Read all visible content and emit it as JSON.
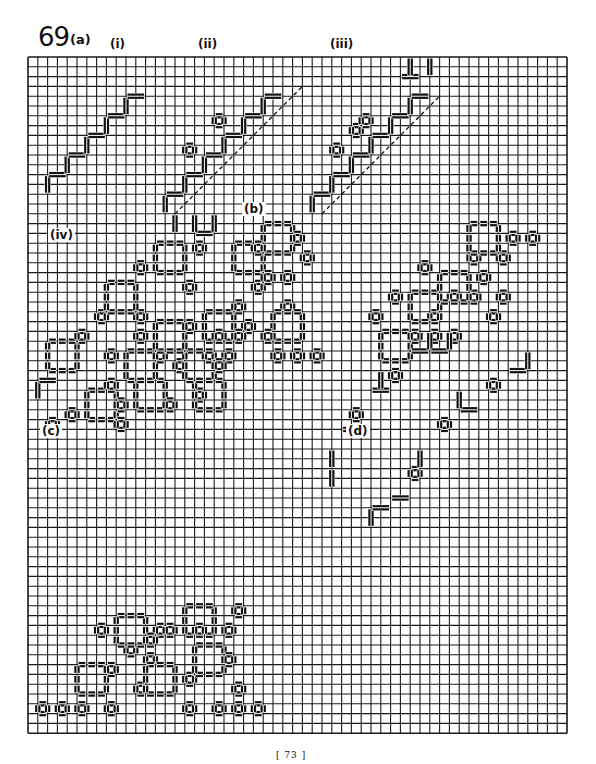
{
  "figure": {
    "number": "69",
    "labels": {
      "a": "(a)",
      "i": "(i)",
      "ii": "(ii)",
      "iii": "(iii)",
      "iv": "(iv)",
      "b": "(b)",
      "c": "(c)",
      "d": "(d)"
    }
  },
  "grid": {
    "x0": 28,
    "y0": 57,
    "cols": 55,
    "rows": 69,
    "cell": 9.8,
    "line_color": "#1a1a1a",
    "stitch_color": "#111111"
  },
  "page_number": "[ 73 ]"
}
